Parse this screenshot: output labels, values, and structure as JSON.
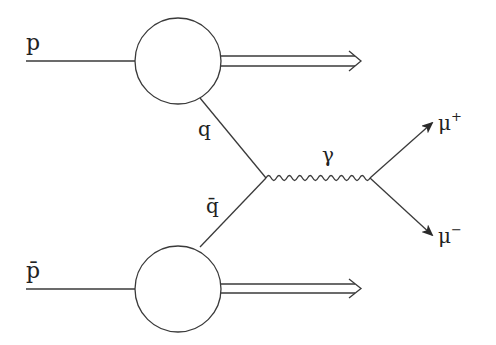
{
  "diagram": {
    "type": "feynman",
    "stroke_color": "#3a3a3a",
    "background": "#ffffff",
    "labels": {
      "proton": "p",
      "antiproton": "p̄",
      "quark": "q",
      "antiquark": "q̄",
      "photon": "γ",
      "muon_plus": "μ",
      "muon_plus_sup": "+",
      "muon_minus": "μ",
      "muon_minus_sup": "−"
    },
    "nodes": [
      {
        "id": "proton-blob",
        "shape": "circle",
        "cx": 178,
        "cy": 61,
        "r": 43
      },
      {
        "id": "antiproton-blob",
        "shape": "circle",
        "cx": 178,
        "cy": 289,
        "r": 43
      },
      {
        "id": "qq-vertex",
        "x": 266,
        "y": 178
      },
      {
        "id": "mumu-vertex",
        "x": 370,
        "y": 178
      }
    ],
    "edges": [
      {
        "from": "left",
        "to": "proton-blob",
        "label": "p",
        "style": "line"
      },
      {
        "from": "proton-blob",
        "to": "right",
        "style": "double-arrow",
        "label": ""
      },
      {
        "from": "proton-blob",
        "to": "qq-vertex",
        "label": "q",
        "style": "line"
      },
      {
        "from": "left",
        "to": "antiproton-blob",
        "label": "p̄",
        "style": "line"
      },
      {
        "from": "antiproton-blob",
        "to": "right",
        "style": "double-arrow",
        "label": ""
      },
      {
        "from": "antiproton-blob",
        "to": "qq-vertex",
        "label": "q̄",
        "style": "line"
      },
      {
        "from": "qq-vertex",
        "to": "mumu-vertex",
        "label": "γ",
        "style": "wavy"
      },
      {
        "from": "mumu-vertex",
        "to": "upper-right",
        "label": "μ+",
        "style": "arrow"
      },
      {
        "from": "mumu-vertex",
        "to": "lower-right",
        "label": "μ−",
        "style": "arrow"
      }
    ]
  }
}
